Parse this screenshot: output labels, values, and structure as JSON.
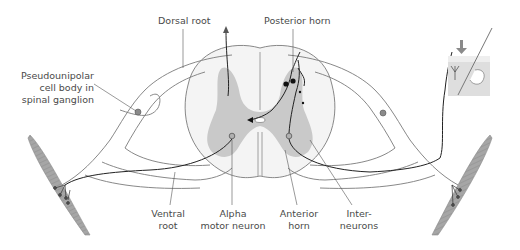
{
  "diagram": {
    "colors": {
      "gray_matter": "#c8c8c8",
      "white_matter": "#f3f3f3",
      "outline": "#6e6e6e",
      "neuron": "#1a1a1a",
      "muscle": "#9a9a9a",
      "label_text": "#4a4a4a",
      "cell_body": "#8a8a8a"
    },
    "labels": {
      "dorsal_root": "Dorsal root",
      "posterior_horn": "Posterior horn",
      "pseudounipolar": [
        "Pseudounipolar",
        "cell body in",
        "spinal ganglion"
      ],
      "ventral_root": [
        "Ventral",
        "root"
      ],
      "alpha_motor_neuron": [
        "Alpha",
        "motor neuron"
      ],
      "anterior_horn": [
        "Anterior",
        "horn"
      ],
      "interneurons": [
        "Inter-",
        "neurons"
      ]
    },
    "elements": [
      "spinal-cord-cross-section",
      "gray-matter-butterfly",
      "central-canal",
      "left-spinal-nerve",
      "right-spinal-nerve",
      "left-muscle",
      "right-muscle",
      "skin-receptor-inset",
      "stimulus-arrow"
    ]
  }
}
